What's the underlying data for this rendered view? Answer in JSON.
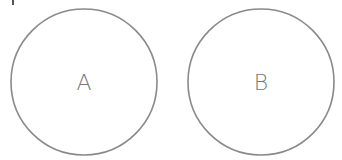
{
  "diagram": {
    "circles": [
      {
        "label": "A",
        "cx": 84,
        "cy": 82,
        "r": 73
      },
      {
        "label": "B",
        "cx": 261,
        "cy": 82,
        "r": 73
      }
    ],
    "stroke_color": "#8a8a8a",
    "label_color": "#7a7a7a"
  }
}
